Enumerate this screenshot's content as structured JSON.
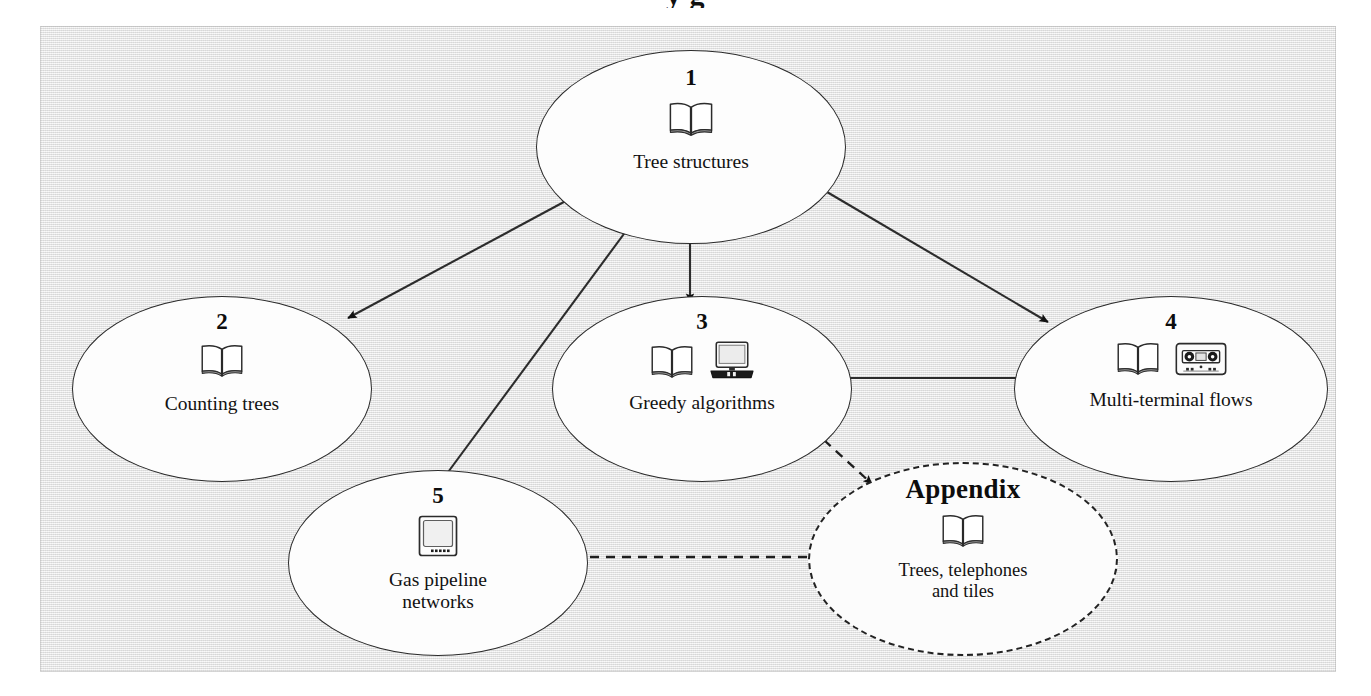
{
  "figure": {
    "cropped_caption_above": "y g",
    "frame_background": "#e9e9e9",
    "ink_color": "#222222"
  },
  "nodes": [
    {
      "id": "node-1",
      "number": "1",
      "label": "Tree structures",
      "icons": [
        "book-icon"
      ],
      "border": "solid"
    },
    {
      "id": "node-2",
      "number": "2",
      "label": "Counting trees",
      "icons": [
        "book-icon"
      ],
      "border": "solid"
    },
    {
      "id": "node-3",
      "number": "3",
      "label": "Greedy algorithms",
      "icons": [
        "book-icon",
        "laptop-icon"
      ],
      "border": "solid"
    },
    {
      "id": "node-4",
      "number": "4",
      "label": "Multi-terminal flows",
      "icons": [
        "book-icon",
        "cassette-tape-icon"
      ],
      "border": "solid"
    },
    {
      "id": "node-5",
      "number": "5",
      "label": "Gas pipeline\nnetworks",
      "icons": [
        "monitor-icon"
      ],
      "border": "solid"
    },
    {
      "id": "node-appendix",
      "number": "Appendix",
      "label": "Trees, telephones\nand tiles",
      "icons": [
        "book-icon"
      ],
      "border": "dashed"
    }
  ],
  "edges": [
    {
      "from": "node-1",
      "to": "node-2",
      "style": "solid",
      "arrow": "filled-triangle"
    },
    {
      "from": "node-1",
      "to": "node-3",
      "style": "solid",
      "arrow": "filled-triangle"
    },
    {
      "from": "node-1",
      "to": "node-4",
      "style": "solid",
      "arrow": "filled-triangle"
    },
    {
      "from": "node-1",
      "to": "node-5",
      "style": "solid",
      "arrow": "filled-triangle"
    },
    {
      "from": "node-3",
      "to": "node-4",
      "style": "solid",
      "arrow": "filled-triangle"
    },
    {
      "from": "node-3",
      "to": "node-appendix",
      "style": "dashed",
      "arrow": "filled-triangle"
    },
    {
      "from": "node-5",
      "to": "node-appendix",
      "style": "dashed",
      "arrow": "filled-triangle"
    }
  ]
}
